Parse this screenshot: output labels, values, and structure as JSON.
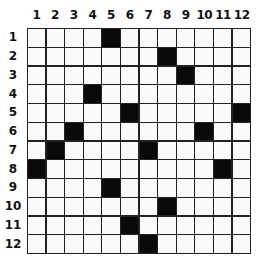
{
  "puzzle": {
    "rows": 12,
    "cols": 12,
    "column_labels": [
      "1",
      "2",
      "3",
      "4",
      "5",
      "6",
      "7",
      "8",
      "9",
      "10",
      "11",
      "12"
    ],
    "row_labels": [
      "1",
      "2",
      "3",
      "4",
      "5",
      "6",
      "7",
      "8",
      "9",
      "10",
      "11",
      "12"
    ],
    "black_cells": [
      [
        1,
        5
      ],
      [
        2,
        8
      ],
      [
        3,
        9
      ],
      [
        4,
        4
      ],
      [
        5,
        6
      ],
      [
        5,
        12
      ],
      [
        6,
        3
      ],
      [
        6,
        10
      ],
      [
        7,
        2
      ],
      [
        7,
        7
      ],
      [
        8,
        1
      ],
      [
        8,
        11
      ],
      [
        9,
        5
      ],
      [
        10,
        8
      ],
      [
        11,
        6
      ],
      [
        12,
        7
      ]
    ],
    "colors": {
      "black_cell": "#0a0a0a",
      "white_cell": "#fafafa",
      "grid_line": "#222222",
      "label": "#111111"
    }
  }
}
